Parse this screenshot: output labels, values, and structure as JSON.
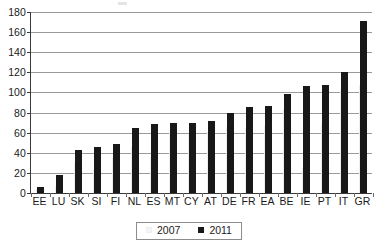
{
  "chart_data": {
    "type": "bar",
    "title": "",
    "subtitle": "",
    "xlabel": "",
    "ylabel": "",
    "ylim": [
      0,
      180
    ],
    "y_ticks": [
      0,
      20,
      40,
      60,
      80,
      100,
      120,
      140,
      160,
      180
    ],
    "grid": true,
    "legend_position": "bottom",
    "categories": [
      "EE",
      "LU",
      "SK",
      "SI",
      "FI",
      "NL",
      "ES",
      "MT",
      "CY",
      "AT",
      "DE",
      "FR",
      "EA",
      "BE",
      "IE",
      "PT",
      "IT",
      "GR"
    ],
    "series": [
      {
        "name": "2007",
        "color": "#f2f2f2",
        "values": [
          3.7,
          6.7,
          29.6,
          23.1,
          35.2,
          45.3,
          36.3,
          60.7,
          58.8,
          60.2,
          65.2,
          64.2,
          66.3,
          84.0,
          24.9,
          68.3,
          103.1,
          107.4
        ]
      },
      {
        "name": "2011",
        "color": "#181818",
        "values": [
          6,
          18,
          43,
          46,
          48.5,
          65,
          68.5,
          70,
          70,
          72,
          80,
          85.5,
          87,
          98,
          106,
          107.5,
          120,
          171
        ]
      }
    ]
  },
  "legend": {
    "items": [
      {
        "label": "2007",
        "swatch": "swatch-2007"
      },
      {
        "label": "2011",
        "swatch": "swatch-2011"
      }
    ]
  },
  "colors": {
    "series_2007": "#f2f2f2",
    "series_2011": "#181818",
    "gridline": "#9a9a9a",
    "axis": "#3a3a3a",
    "text": "#1a1a1a",
    "background": "#ffffff"
  }
}
